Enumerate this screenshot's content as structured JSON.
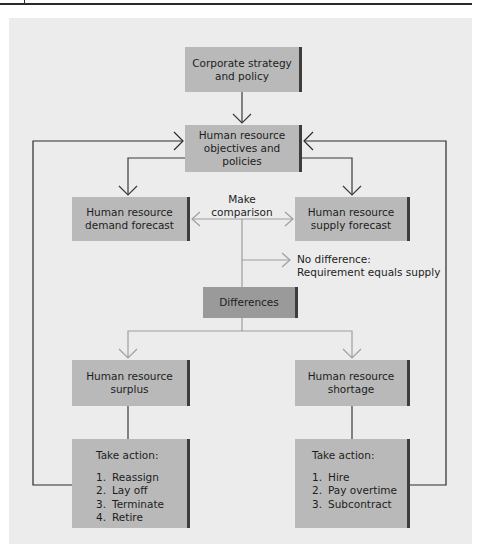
{
  "diagram": {
    "type": "flowchart",
    "colors": {
      "panel_bg": "#ececec",
      "box_fill": "#b9b9b9",
      "box_dark_fill": "#9a9a9a",
      "box_shadow": "#3d3d3d",
      "feedback_line": "#2a2a2a",
      "comparison_line": "#9e9e9e"
    },
    "nodes": {
      "corporate": {
        "label": "Corporate strategy\nand policy"
      },
      "objectives": {
        "label": "Human resource\nobjectives and\npolicies"
      },
      "demand": {
        "label": "Human resource\ndemand forecast"
      },
      "supply": {
        "label": "Human resource\nsupply forecast"
      },
      "differences": {
        "label": "Differences"
      },
      "surplus": {
        "label": "Human resource\nsurplus"
      },
      "shortage": {
        "label": "Human resource\nshortage"
      },
      "surplus_action": {
        "title": "Take action:",
        "items": [
          {
            "num": "1.",
            "text": "Reassign"
          },
          {
            "num": "2.",
            "text": "Lay off"
          },
          {
            "num": "3.",
            "text": "Terminate"
          },
          {
            "num": "4.",
            "text": "Retire"
          }
        ]
      },
      "shortage_action": {
        "title": "Take action:",
        "items": [
          {
            "num": "1.",
            "text": "Hire"
          },
          {
            "num": "2.",
            "text": "Pay overtime"
          },
          {
            "num": "3.",
            "text": "Subcontract"
          }
        ]
      }
    },
    "labels": {
      "make_comparison": "Make\ncomparison",
      "no_difference": "No difference:\nRequirement equals supply"
    },
    "edges": [
      {
        "from": "corporate",
        "to": "objectives"
      },
      {
        "from": "objectives",
        "to": "demand"
      },
      {
        "from": "objectives",
        "to": "supply"
      },
      {
        "from": "demand",
        "to": "supply",
        "label": "Make comparison",
        "bidirectional": true
      },
      {
        "from": "comparison",
        "to": "no_difference"
      },
      {
        "from": "comparison",
        "to": "differences"
      },
      {
        "from": "differences",
        "to": "surplus"
      },
      {
        "from": "differences",
        "to": "shortage"
      },
      {
        "from": "surplus",
        "to": "surplus_action"
      },
      {
        "from": "shortage",
        "to": "shortage_action"
      },
      {
        "from": "surplus_action",
        "to": "objectives",
        "type": "feedback"
      },
      {
        "from": "shortage_action",
        "to": "objectives",
        "type": "feedback"
      }
    ]
  }
}
